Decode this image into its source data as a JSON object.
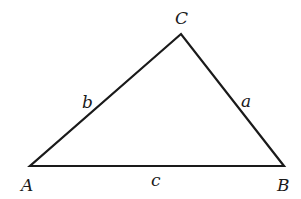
{
  "diagram": {
    "type": "triangle",
    "vertices": [
      {
        "label": "A",
        "x": 30,
        "y": 166
      },
      {
        "label": "B",
        "x": 284,
        "y": 166
      },
      {
        "label": "C",
        "x": 181,
        "y": 34
      }
    ],
    "sides": [
      {
        "label": "a",
        "between": "B-C"
      },
      {
        "label": "b",
        "between": "A-C"
      },
      {
        "label": "c",
        "between": "A-B"
      }
    ],
    "line_color": "#1a1a1a",
    "background": "#ffffff"
  }
}
